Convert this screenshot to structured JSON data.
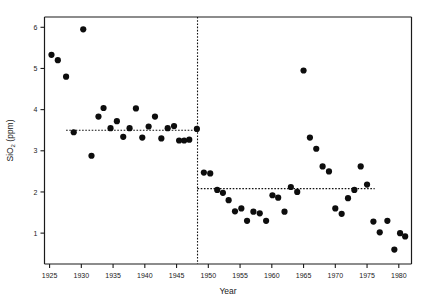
{
  "chart_data": {
    "type": "scatter",
    "title": "",
    "xlabel": "Year",
    "ylabel": "SiO2 (ppm)",
    "ylabel_parts": {
      "main": "SiO",
      "subscript": "2",
      "units": " (ppm)"
    },
    "xlim": [
      1924.2,
      1982.0
    ],
    "ylim": [
      0.25,
      6.25
    ],
    "xticks": [
      1925,
      1930,
      1935,
      1940,
      1945,
      1950,
      1955,
      1960,
      1965,
      1970,
      1975,
      1980
    ],
    "xtick_labels": [
      "1925",
      "1930",
      "1935",
      "1940",
      "1945",
      "1950",
      "1955",
      "1960",
      "1965",
      "1970",
      "1975",
      "1980"
    ],
    "yticks": [
      1,
      2,
      3,
      4,
      5,
      6
    ],
    "ytick_labels": [
      "1",
      "2",
      "3",
      "4",
      "5",
      "6"
    ],
    "grid": false,
    "legend": false,
    "marker": {
      "shape": "circle",
      "size": 3.1,
      "color": "#0d0d0d"
    },
    "x": [
      1925.3,
      1926.3,
      1927.6,
      1928.8,
      1930.3,
      1931.6,
      1932.7,
      1933.5,
      1934.6,
      1935.6,
      1936.6,
      1937.6,
      1938.6,
      1939.6,
      1940.6,
      1941.6,
      1942.6,
      1943.6,
      1944.6,
      1945.4,
      1946.2,
      1947.0,
      1948.2,
      1949.3,
      1950.3,
      1951.4,
      1952.3,
      1953.2,
      1954.2,
      1955.2,
      1956.1,
      1957.1,
      1958.1,
      1959.1,
      1960.1,
      1961.0,
      1962.0,
      1963.0,
      1964.0,
      1965.0,
      1966.0,
      1967.0,
      1968.0,
      1969.0,
      1970.0,
      1971.0,
      1972.0,
      1973.0,
      1974.0,
      1975.0,
      1976.0,
      1977.0,
      1978.2,
      1979.3,
      1980.2,
      1981.0
    ],
    "y": [
      5.33,
      5.2,
      4.8,
      3.45,
      5.95,
      2.88,
      3.83,
      4.04,
      3.55,
      3.72,
      3.34,
      3.55,
      4.03,
      3.32,
      3.59,
      3.83,
      3.3,
      3.55,
      3.6,
      3.25,
      3.25,
      3.27,
      3.53,
      2.47,
      2.45,
      2.05,
      1.98,
      1.8,
      1.53,
      1.6,
      1.3,
      1.52,
      1.48,
      1.3,
      1.92,
      1.86,
      1.52,
      2.12,
      2.0,
      4.95,
      3.32,
      3.05,
      2.62,
      2.5,
      1.6,
      1.47,
      1.85,
      2.05,
      2.62,
      2.18,
      1.28,
      1.02,
      1.3,
      0.6,
      1.0,
      0.92
    ],
    "annotations": [
      {
        "name": "pre-break-mean-line",
        "type": "hline",
        "y": 3.5,
        "x_start": 1927.6,
        "x_end": 1948.5,
        "style": "dotted"
      },
      {
        "name": "post-break-mean-line",
        "type": "hline",
        "y": 2.08,
        "x_start": 1948.3,
        "x_end": 1976.2,
        "style": "dotted"
      },
      {
        "name": "changepoint-line",
        "type": "vline",
        "x": 1948.3,
        "y_start": 0.25,
        "y_end": 6.25,
        "style": "dotted"
      }
    ]
  }
}
